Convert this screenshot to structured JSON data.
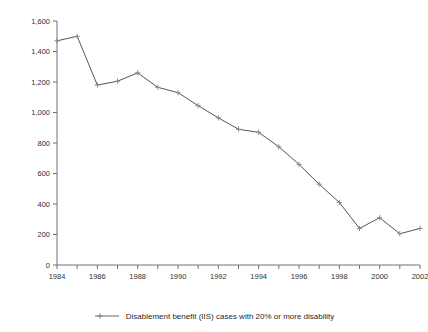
{
  "chart_data": {
    "type": "line",
    "title": "",
    "subtitle": "",
    "xlabel": "",
    "ylabel": "",
    "xlim": [
      1984,
      2002
    ],
    "ylim": [
      0,
      1600
    ],
    "ytick_step": 200,
    "grid": false,
    "legend_position": "bottom",
    "x": [
      1984,
      1985,
      1986,
      1987,
      1988,
      1989,
      1990,
      1991,
      1992,
      1993,
      1994,
      1995,
      1996,
      1997,
      1998,
      1999,
      2000,
      2001,
      2002
    ],
    "xtick_labels": [
      "1984",
      "",
      "1986",
      "",
      "1988",
      "",
      "1990",
      "",
      "1992",
      "",
      "1994",
      "",
      "1996",
      "",
      "1998",
      "",
      "2000",
      "",
      "2002"
    ],
    "ytick_labels": [
      "0",
      "200",
      "400",
      "600",
      "800",
      "1,000",
      "1,200",
      "1,400",
      "1,600"
    ],
    "ytick_values": [
      0,
      200,
      400,
      600,
      800,
      1000,
      1200,
      1400,
      1600
    ],
    "series": [
      {
        "name": "Disablement benefit (IIS) cases with 20% or more disability",
        "color": "#555555",
        "marker": "plus",
        "values": [
          1470,
          1500,
          1180,
          1205,
          1260,
          1165,
          1130,
          1045,
          965,
          890,
          870,
          775,
          660,
          530,
          410,
          240,
          310,
          205,
          240
        ]
      }
    ]
  },
  "legend": {
    "entries": [
      {
        "label": "Disablement benefit (IIS) cases with 20% or more disability",
        "color": "#555555"
      }
    ]
  },
  "axes": {
    "y_axis_name": "value-axis",
    "x_axis_name": "year-axis"
  }
}
